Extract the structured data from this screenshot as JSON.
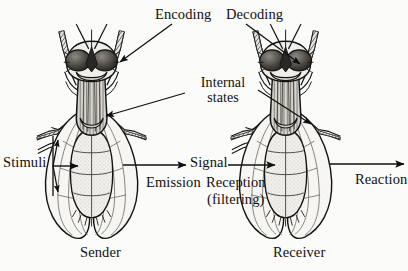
{
  "figure": {
    "background_color": "#fbfbfa",
    "ink_color": "#101010",
    "labels": {
      "encoding": "Encoding",
      "decoding": "Decoding",
      "internal_states_line1": "Internal",
      "internal_states_line2": "states",
      "stimuli": "Stimuli",
      "signal": "Signal",
      "emission": "Emission",
      "reception": "Reception",
      "filtering": "(filtering)",
      "reaction": "Reaction",
      "sender": "Sender",
      "receiver": "Receiver"
    },
    "organisms": [
      {
        "role": "sender",
        "caption": "Sender",
        "species_depiction": "fly"
      },
      {
        "role": "receiver",
        "caption": "Receiver",
        "species_depiction": "fly"
      }
    ],
    "flow": [
      "Stimuli",
      "Encoding",
      "Internal states",
      "Emission",
      "Signal",
      "Reception (filtering)",
      "Decoding",
      "Internal states",
      "Reaction"
    ]
  }
}
